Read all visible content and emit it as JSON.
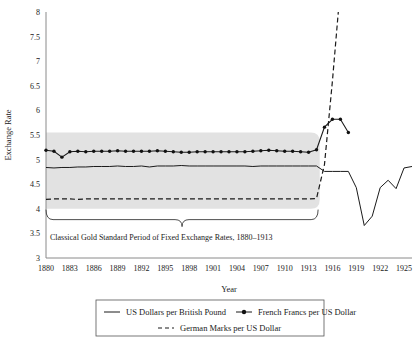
{
  "chart_data": {
    "type": "line",
    "title": "",
    "xlabel": "Year",
    "ylabel": "Exchange Rate",
    "xlim": [
      1880,
      1926
    ],
    "ylim": [
      3,
      8
    ],
    "ytick_step": 0.5,
    "xtick_step": 3,
    "grid": false,
    "legend_position": "bottom",
    "xticks": [
      "1880",
      "1883",
      "1886",
      "1889",
      "1892",
      "1895",
      "1898",
      "1901",
      "1904",
      "1907",
      "1910",
      "1913",
      "1916",
      "1919",
      "1922",
      "1925"
    ],
    "yticks": [
      "3",
      "3.5",
      "4",
      "4.5",
      "5",
      "5.5",
      "6",
      "6.5",
      "7",
      "7.5",
      "8"
    ],
    "x": [
      1880,
      1881,
      1882,
      1883,
      1884,
      1885,
      1886,
      1887,
      1888,
      1889,
      1890,
      1891,
      1892,
      1893,
      1894,
      1895,
      1896,
      1897,
      1898,
      1899,
      1900,
      1901,
      1902,
      1903,
      1904,
      1905,
      1906,
      1907,
      1908,
      1909,
      1910,
      1911,
      1912,
      1913,
      1914,
      1915,
      1916,
      1917,
      1918,
      1919,
      1920,
      1921,
      1922,
      1923,
      1924,
      1925,
      1926
    ],
    "series": [
      {
        "name": "US Dollars per British Pound",
        "style": "solid",
        "marker": "none",
        "values": [
          4.84,
          4.83,
          4.84,
          4.84,
          4.85,
          4.85,
          4.86,
          4.86,
          4.86,
          4.87,
          4.86,
          4.86,
          4.87,
          4.85,
          4.87,
          4.87,
          4.87,
          4.88,
          4.87,
          4.87,
          4.87,
          4.87,
          4.87,
          4.87,
          4.87,
          4.87,
          4.86,
          4.87,
          4.87,
          4.87,
          4.87,
          4.87,
          4.87,
          4.87,
          4.87,
          4.76,
          4.76,
          4.76,
          4.76,
          4.43,
          3.66,
          3.85,
          4.43,
          4.58,
          4.41,
          4.83,
          4.86
        ]
      },
      {
        "name": "French Francs per US Dollar",
        "style": "solid",
        "marker": "dot",
        "values": [
          5.19,
          5.17,
          5.05,
          5.16,
          5.17,
          5.16,
          5.17,
          5.17,
          5.17,
          5.18,
          5.17,
          5.17,
          5.17,
          5.17,
          5.18,
          5.17,
          5.16,
          5.15,
          5.15,
          5.16,
          5.16,
          5.16,
          5.16,
          5.16,
          5.16,
          5.16,
          5.17,
          5.18,
          5.19,
          5.18,
          5.17,
          5.17,
          5.16,
          5.15,
          5.2,
          5.66,
          5.82,
          5.82,
          5.55,
          null,
          null,
          null,
          null,
          null,
          null,
          null,
          null
        ]
      },
      {
        "name": "German Marks per US Dollar",
        "style": "dashed",
        "marker": "none",
        "values": [
          4.19,
          4.2,
          4.2,
          4.2,
          4.19,
          4.2,
          4.2,
          4.2,
          4.2,
          4.2,
          4.2,
          4.2,
          4.2,
          4.2,
          4.2,
          4.2,
          4.2,
          4.2,
          4.2,
          4.2,
          4.2,
          4.2,
          4.2,
          4.2,
          4.2,
          4.2,
          4.2,
          4.2,
          4.2,
          4.2,
          4.2,
          4.2,
          4.2,
          4.2,
          4.21,
          4.9,
          6.6,
          8.5,
          null,
          null,
          null,
          null,
          null,
          null,
          null,
          null,
          null
        ]
      }
    ],
    "band": {
      "label": "Classical Gold Standard shaded region",
      "x_start": 1880,
      "x_end": 1914.4,
      "y_low": 4.0,
      "y_high": 5.55,
      "color": "#e2e2e2"
    },
    "annotation": {
      "text": "Classical Gold Standard Period of Fixed Exchange Rates, 1880–1913",
      "brace_x_start": 1880,
      "brace_x_end": 1914.2,
      "brace_y": 3.78
    }
  },
  "legend": {
    "items": [
      {
        "label": "US Dollars per British Pound",
        "style": "solid",
        "marker": "none"
      },
      {
        "label": "French Francs per US Dollar",
        "style": "solid",
        "marker": "dot"
      },
      {
        "label": "German Marks per US Dollar",
        "style": "dashed",
        "marker": "none"
      }
    ]
  }
}
